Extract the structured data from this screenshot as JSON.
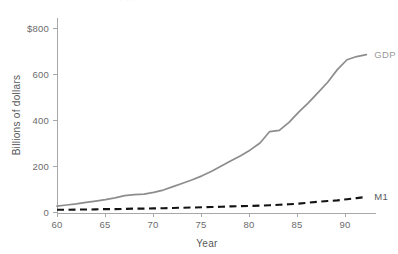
{
  "figure": {
    "cropped_title": "· ···",
    "background_color": "#ffffff"
  },
  "chart_data": {
    "type": "line",
    "title": "",
    "xlabel": "Year",
    "ylabel": "Billions of dollars",
    "xlim": [
      60,
      93
    ],
    "ylim": [
      0,
      850
    ],
    "grid": false,
    "legend_position": "right-of-line-end",
    "xticks": [
      60,
      65,
      70,
      75,
      80,
      85,
      90
    ],
    "xtick_labels": [
      "60",
      "65",
      "70",
      "75",
      "80",
      "85",
      "90"
    ],
    "yticks": [
      0,
      200,
      400,
      600,
      800
    ],
    "ytick_labels": [
      "0",
      "200",
      "400",
      "600",
      "$800"
    ],
    "x": [
      60,
      61,
      62,
      63,
      64,
      65,
      66,
      67,
      68,
      69,
      70,
      71,
      72,
      73,
      74,
      75,
      76,
      77,
      78,
      79,
      80,
      81,
      82,
      83,
      84,
      85,
      86,
      87,
      88,
      89,
      90,
      91,
      92
    ],
    "series": [
      {
        "name": "GDP",
        "label": "GDP",
        "color": "#8d8d8f",
        "style": "solid",
        "values": [
          30,
          35,
          40,
          46,
          52,
          58,
          66,
          76,
          80,
          82,
          90,
          100,
          115,
          130,
          145,
          162,
          182,
          205,
          228,
          250,
          275,
          305,
          355,
          360,
          395,
          440,
          480,
          525,
          570,
          625,
          668,
          682,
          690
        ]
      },
      {
        "name": "M1",
        "label": "M1",
        "color": "#131313",
        "style": "dashed",
        "values": [
          14,
          14,
          15,
          15,
          16,
          17,
          17,
          18,
          19,
          19,
          20,
          21,
          22,
          23,
          24,
          25,
          26,
          27,
          29,
          30,
          31,
          32,
          34,
          36,
          38,
          41,
          45,
          49,
          52,
          55,
          60,
          65,
          70
        ]
      }
    ]
  },
  "annotations": {
    "gdp_label": "GDP",
    "m1_label": "M1"
  }
}
